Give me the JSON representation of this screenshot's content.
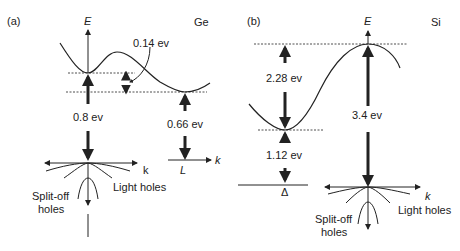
{
  "panel_a": {
    "tag": "(a)",
    "material": "Ge",
    "axis_e": "E",
    "axis_k": "k",
    "axis_k2": "k",
    "point_l": "L",
    "gap_direct": "0.8 ev",
    "gap_indirect": "0.66 ev",
    "gap_diff": "0.14 ev",
    "split_off": [
      "Split-off",
      "holes"
    ],
    "light_holes": "Light holes"
  },
  "panel_b": {
    "tag": "(b)",
    "material": "Si",
    "axis_e": "E",
    "axis_k": "k",
    "point_delta": "Δ",
    "gap_top": "2.28 ev",
    "gap_indirect": "1.12 ev",
    "gap_direct": "3.4 ev",
    "split_off": [
      "Split-off",
      "holes"
    ],
    "light_holes": "Light holes"
  }
}
